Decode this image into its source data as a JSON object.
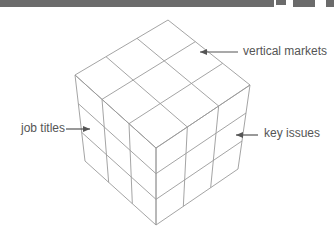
{
  "diagram": {
    "type": "3x3x3 cube (three-dimensional matrix)",
    "labels": {
      "vertical_markets": "vertical markets",
      "job_titles": "job titles",
      "key_issues": "key issues"
    },
    "colors": {
      "line": "#9a9a9a",
      "arrow": "#555555",
      "text": "#555555",
      "header_bar": "#6b6b6b"
    }
  }
}
